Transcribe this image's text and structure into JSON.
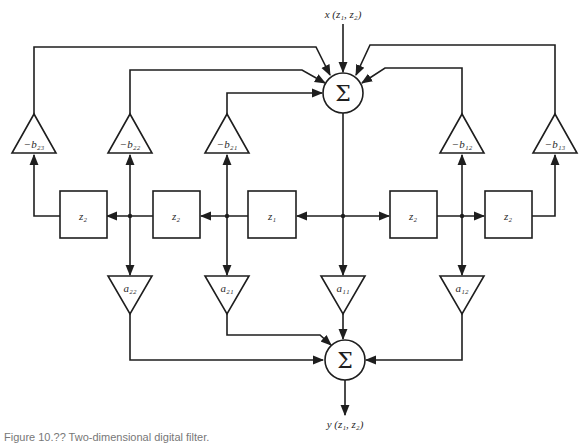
{
  "diagram": {
    "input_label": "x (z₁, z₂)",
    "output_label": "y (z₁, z₂)",
    "summer_symbol": "Σ",
    "delays": {
      "z2_left_outer": "z₂",
      "z2_left_inner": "z₂",
      "z1_center": "z₁",
      "z2_right_inner": "z₂",
      "z2_right_outer": "z₂"
    },
    "feedback_gains": {
      "b23": "−b₂₃",
      "b22": "−b₂₂",
      "b21": "−b₂₁",
      "b12": "−b₁₂",
      "b13": "−b₁₃"
    },
    "feedforward_gains": {
      "a22": "a₂₂",
      "a21": "a₂₁",
      "a11": "a₁₁",
      "a12": "a₁₂"
    },
    "colors": {
      "line": "#1e1e1e",
      "background": "#ffffff"
    }
  },
  "caption": "Figure 10.?? Two-dimensional digital filter."
}
